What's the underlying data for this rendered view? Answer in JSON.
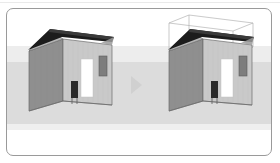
{
  "figure": {
    "type": "before-after-illustration",
    "left_caption": "",
    "right_caption": "",
    "arrow_direction": "right"
  },
  "card": {
    "border_color": "#9a9a9a",
    "background": "#ffffff",
    "corner_radius_px": 7
  },
  "bands": {
    "upper_color": "#ededed",
    "mid_color": "#dcdcdc",
    "lower_color": "#efefef"
  },
  "arrow": {
    "name": "next-step-arrow",
    "color": "#d0d0d0",
    "glyph": "triangle-right"
  },
  "houses": [
    {
      "id": "house-before",
      "label": "",
      "has_bounding_box": false,
      "wall_front_color": "#c9c9c9",
      "wall_side_color": "#8f8f8f",
      "gable_color": "#b5b5b5",
      "roof_color": "#1c1c1c",
      "roof_underside_color": "#565656",
      "door_color": "#ffffff",
      "window_color": "#7d7d7d",
      "opening_color": "#2a2a2a",
      "outline_color": "#6b6b6b"
    },
    {
      "id": "house-after",
      "label": "",
      "has_bounding_box": true,
      "wall_front_color": "#c9c9c9",
      "wall_side_color": "#8f8f8f",
      "gable_color": "#b5b5b5",
      "roof_color": "#1c1c1c",
      "roof_underside_color": "#565656",
      "door_color": "#ffffff",
      "window_color": "#7d7d7d",
      "opening_color": "#2a2a2a",
      "outline_color": "#6b6b6b",
      "bounding_box_color": "#b3b3b3"
    }
  ]
}
